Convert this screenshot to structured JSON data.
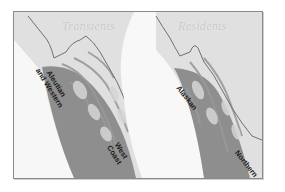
{
  "figure": {
    "panels": [
      {
        "title": "Transients",
        "regions": [
          {
            "label_line1": "Aleutian",
            "label_line2": "and Western"
          },
          {
            "label_line1": "West",
            "label_line2": "Coast"
          }
        ]
      },
      {
        "title": "Residents",
        "regions": [
          {
            "label_line1": "Alaskan"
          },
          {
            "label_line1": "Northern"
          }
        ]
      }
    ],
    "colors": {
      "land": "#e2e2e2",
      "ocean": "#f7f7f7",
      "range_shade": "#8c8c8c",
      "channels": "#9a9a9a",
      "border_line": "#6e6e6e",
      "title_text": "#c4c4c4",
      "label_text": "#1a1a1a"
    }
  }
}
